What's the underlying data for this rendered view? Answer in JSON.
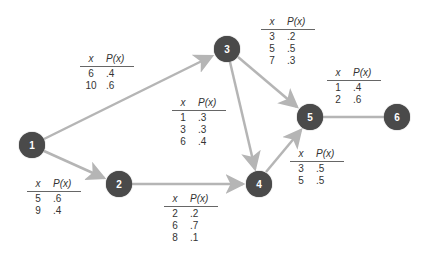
{
  "diagram": {
    "type": "network",
    "node_color": "#4a4a4a",
    "edge_color": "#b5b5b5",
    "nodes": [
      {
        "id": "1",
        "label": "1",
        "x": 32,
        "y": 145
      },
      {
        "id": "2",
        "label": "2",
        "x": 119,
        "y": 184
      },
      {
        "id": "3",
        "label": "3",
        "x": 227,
        "y": 49
      },
      {
        "id": "4",
        "label": "4",
        "x": 259,
        "y": 184
      },
      {
        "id": "5",
        "label": "5",
        "x": 310,
        "y": 117
      },
      {
        "id": "6",
        "label": "6",
        "x": 397,
        "y": 117
      }
    ],
    "edges": [
      {
        "from": "1",
        "to": "3",
        "arrow": true
      },
      {
        "from": "1",
        "to": "2",
        "arrow": true
      },
      {
        "from": "2",
        "to": "4",
        "arrow": true
      },
      {
        "from": "3",
        "to": "4",
        "arrow": true
      },
      {
        "from": "3",
        "to": "5",
        "arrow": true
      },
      {
        "from": "4",
        "to": "5",
        "arrow": true
      },
      {
        "from": "5",
        "to": "6",
        "arrow": false
      }
    ],
    "tables": {
      "edge_1_3": {
        "header": {
          "x": "x",
          "p": "P(x)"
        },
        "rows": [
          {
            "x": "6",
            "p": ".4"
          },
          {
            "x": "10",
            "p": ".6"
          }
        ]
      },
      "edge_1_2": {
        "header": {
          "x": "x",
          "p": "P(x)"
        },
        "rows": [
          {
            "x": "5",
            "p": ".6"
          },
          {
            "x": "9",
            "p": ".4"
          }
        ]
      },
      "edge_3_4": {
        "header": {
          "x": "x",
          "p": "P(x)"
        },
        "rows": [
          {
            "x": "1",
            "p": ".3"
          },
          {
            "x": "3",
            "p": ".3"
          },
          {
            "x": "6",
            "p": ".4"
          }
        ]
      },
      "edge_2_4": {
        "header": {
          "x": "x",
          "p": "P(x)"
        },
        "rows": [
          {
            "x": "2",
            "p": ".2"
          },
          {
            "x": "6",
            "p": ".7"
          },
          {
            "x": "8",
            "p": ".1"
          }
        ]
      },
      "edge_3_5": {
        "header": {
          "x": "x",
          "p": "P(x)"
        },
        "rows": [
          {
            "x": "3",
            "p": ".2"
          },
          {
            "x": "5",
            "p": ".5"
          },
          {
            "x": "7",
            "p": ".3"
          }
        ]
      },
      "edge_4_5": {
        "header": {
          "x": "x",
          "p": "P(x)"
        },
        "rows": [
          {
            "x": "3",
            "p": ".5"
          },
          {
            "x": "5",
            "p": ".5"
          }
        ]
      },
      "edge_5_6": {
        "header": {
          "x": "x",
          "p": "P(x)"
        },
        "rows": [
          {
            "x": "1",
            "p": ".4"
          },
          {
            "x": "2",
            "p": ".6"
          }
        ]
      }
    }
  }
}
